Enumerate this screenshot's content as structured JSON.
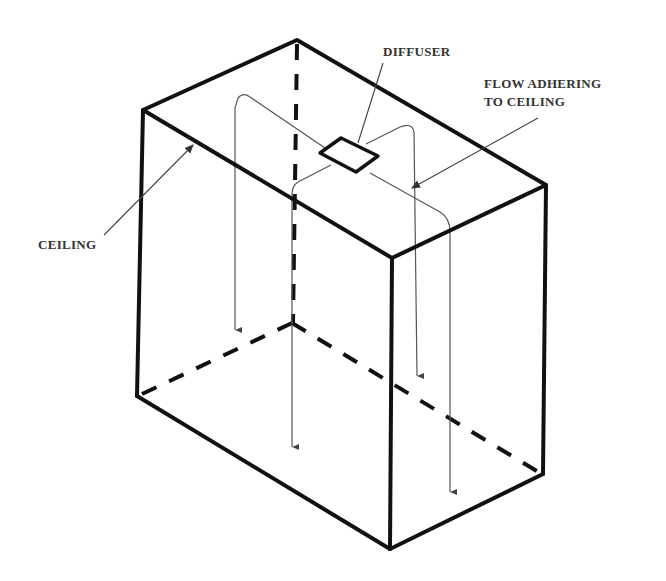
{
  "figure": {
    "type": "isometric-room-airflow-diagram",
    "background": "#ffffff",
    "line_color": "#111111",
    "flow_color": "#555555"
  },
  "labels": {
    "diffuser": "DIFFUSER",
    "flow_line1": "FLOW ADHERING",
    "flow_line2": "TO CEILING",
    "ceiling": "CEILING"
  },
  "room": {
    "vertices": {
      "top_back": [
        297,
        40
      ],
      "top_left": [
        143,
        110
      ],
      "top_right": [
        546,
        185
      ],
      "top_front": [
        392,
        258
      ],
      "bottom_left": [
        137,
        396
      ],
      "bottom_back_hidden": [
        292,
        323
      ],
      "bottom_front": [
        390,
        549
      ],
      "bottom_right": [
        543,
        474
      ]
    }
  },
  "diffuser": {
    "center": [
      342,
      154
    ]
  },
  "flows": [
    {
      "name": "flow-left",
      "direction": "down",
      "ends_y": 330
    },
    {
      "name": "flow-back-center",
      "direction": "down",
      "ends_y": 447
    },
    {
      "name": "flow-right-back",
      "direction": "down",
      "ends_y": 376
    },
    {
      "name": "flow-front-right",
      "direction": "down",
      "ends_y": 492
    }
  ]
}
